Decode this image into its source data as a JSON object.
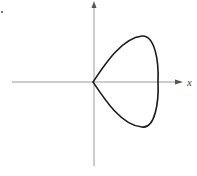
{
  "figure": {
    "type": "curve-plot",
    "axes": {
      "x_label": "x",
      "y_label": "",
      "origin_px": [
        93,
        82
      ],
      "x_axis": {
        "from_px": 12,
        "to_px": 183
      },
      "y_axis": {
        "from_px": 2,
        "to_px": 166
      }
    },
    "curve": {
      "cusp_px": [
        93,
        82
      ],
      "top_px": [
        142,
        36
      ],
      "rightmost_px": [
        158,
        82
      ],
      "bottom_px": [
        142,
        127
      ]
    },
    "corner_mark": "·",
    "colors": {
      "axis": "#9a9a9a",
      "curve": "#1a1a1a",
      "label": "#444444",
      "background": "#ffffff"
    }
  }
}
